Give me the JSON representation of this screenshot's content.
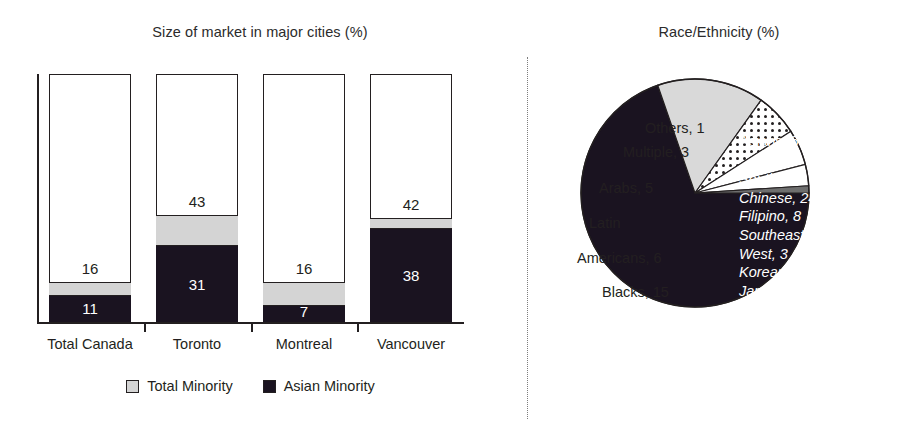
{
  "bar_panel": {
    "title": "Size of market in major cities (%)",
    "legend": [
      {
        "label": "Total Minority",
        "swatch": "light-gray-square"
      },
      {
        "label": "Asian Minority",
        "swatch": "black-square"
      }
    ]
  },
  "pie_panel": {
    "title": "Race/Ethnicity (%)"
  },
  "chart_data": [
    {
      "type": "bar",
      "title": "Size of market in major cities (%)",
      "xlabel": "",
      "ylabel": "",
      "ylim": [
        0,
        100
      ],
      "grid": false,
      "stacked_overlay": true,
      "legend_position": "bottom-center",
      "categories": [
        "Total Canada",
        "Toronto",
        "Montreal",
        "Vancouver"
      ],
      "series": [
        {
          "name": "Total Minority",
          "values": [
            16,
            43,
            16,
            42
          ],
          "color": "#d4d4d4"
        },
        {
          "name": "Asian Minority",
          "values": [
            11,
            31,
            7,
            38
          ],
          "color": "#1a1320"
        }
      ],
      "bars": [
        {
          "category": "Total Canada",
          "total_minority": 16,
          "asian_minority": 11
        },
        {
          "category": "Toronto",
          "total_minority": 43,
          "asian_minority": 31
        },
        {
          "category": "Montreal",
          "total_minority": 16,
          "asian_minority": 7
        },
        {
          "category": "Vancouver",
          "total_minority": 42,
          "asian_minority": 38
        }
      ]
    },
    {
      "type": "pie",
      "title": "Race/Ethnicity (%)",
      "legend_position": "labels-on-slices",
      "labels": [
        "Asians",
        "Blacks",
        "Latin Americans",
        "Arabs",
        "Multiple",
        "Others"
      ],
      "values": [
        69,
        15,
        6,
        5,
        3,
        1
      ],
      "slices": [
        {
          "label": "Asians",
          "value": 69,
          "text": "Asians, 69",
          "fill": "#1a1320",
          "text_color": "#ffffff"
        },
        {
          "label": "Blacks",
          "value": 15,
          "text": "Blacks, 15",
          "fill": "#d9d9d9",
          "text_color": "#231f20"
        },
        {
          "label": "Latin Americans",
          "value": 6,
          "text": "Latin Americans, 6",
          "fill": "#ffffff-dotted",
          "text_color": "#231f20"
        },
        {
          "label": "Arabs",
          "value": 5,
          "text": "Arabs, 5",
          "fill": "#ffffff",
          "text_color": "#231f20"
        },
        {
          "label": "Multiple",
          "value": 3,
          "text": "Multiple, 3",
          "fill": "#ffffff",
          "text_color": "#231f20"
        },
        {
          "label": "Others",
          "value": 1,
          "text": "Others, 1",
          "fill": "#6e6e6e",
          "text_color": "#231f20"
        }
      ],
      "annotations": {
        "asian_breakdown_title": "Asians, 69",
        "asian_breakdown": [
          {
            "label": "South",
            "value": 25,
            "text": "South, 25"
          },
          {
            "label": "Chinese",
            "value": 24,
            "text": "Chinese, 24"
          },
          {
            "label": "Filipino",
            "value": 8,
            "text": "Filipino, 8"
          },
          {
            "label": "Southeast",
            "value": 5,
            "text": "Southeast, 5"
          },
          {
            "label": "West",
            "value": 3,
            "text": "West, 3"
          },
          {
            "label": "Korean",
            "value": 3,
            "text": "Korean, 3"
          },
          {
            "label": "Japanese",
            "value": 2,
            "text": "Japanese, 2"
          }
        ]
      }
    }
  ],
  "pie_labels": {
    "others": "Others, 1",
    "multiple": "Multiple, 3",
    "arabs": "Arabs, 5",
    "latin_line1": "Latin",
    "latin_line2": "Americans, 6",
    "blacks": "Blacks, 15",
    "asians": "Asians, 69"
  },
  "colors": {
    "asian_minority": "#1a1320",
    "total_minority": "#d4d4d4",
    "blacks_slice": "#d9d9d9",
    "others_slice": "#6e6e6e",
    "ink": "#231f20"
  }
}
